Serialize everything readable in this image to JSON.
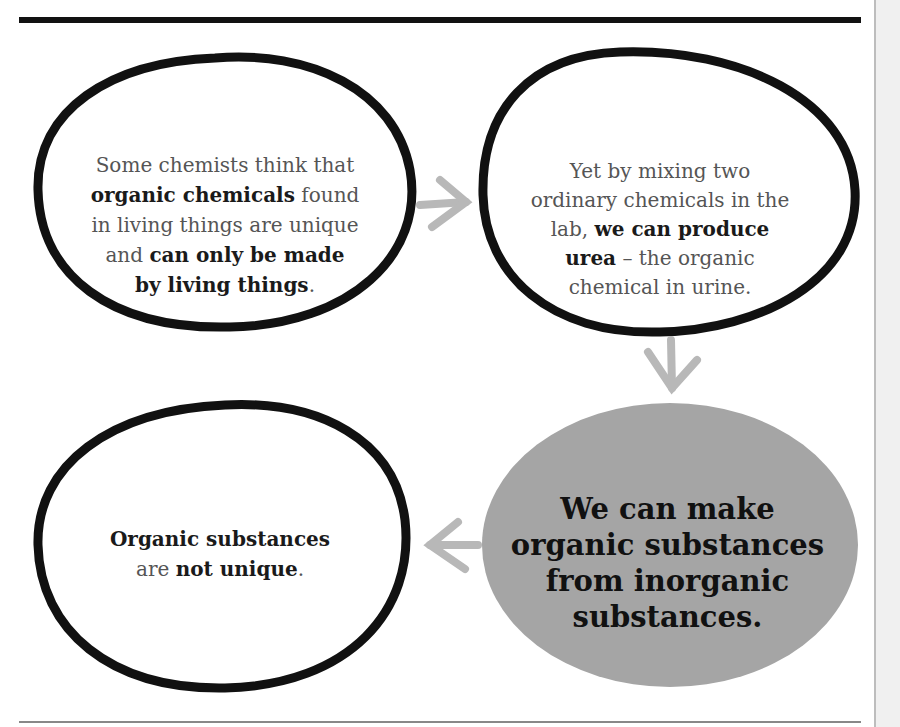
{
  "diagram": {
    "type": "flow",
    "colors": {
      "ink": "#111111",
      "arrow": "#b8b8b8",
      "highlight_fill": "#a5a5a5",
      "text_light": "#555555"
    },
    "nodes": [
      {
        "id": "belief",
        "shape": "hand-drawn-ellipse",
        "lines": [
          {
            "parts": [
              {
                "text": "Some chemists think that",
                "bold": false
              }
            ]
          },
          {
            "parts": [
              {
                "text": "organic chemicals",
                "bold": true
              },
              {
                "text": " found",
                "bold": false
              }
            ]
          },
          {
            "parts": [
              {
                "text": "in living things are unique",
                "bold": false
              }
            ]
          },
          {
            "parts": [
              {
                "text": "and ",
                "bold": false
              },
              {
                "text": "can only be made",
                "bold": true
              }
            ]
          },
          {
            "parts": [
              {
                "text": "by living things",
                "bold": true
              },
              {
                "text": ".",
                "bold": false
              }
            ]
          }
        ]
      },
      {
        "id": "experiment",
        "shape": "hand-drawn-ellipse",
        "lines": [
          {
            "parts": [
              {
                "text": "Yet by mixing two",
                "bold": false
              }
            ]
          },
          {
            "parts": [
              {
                "text": "ordinary chemicals in the",
                "bold": false
              }
            ]
          },
          {
            "parts": [
              {
                "text": "lab, ",
                "bold": false
              },
              {
                "text": "we can produce",
                "bold": true
              }
            ]
          },
          {
            "parts": [
              {
                "text": "urea",
                "bold": true
              },
              {
                "text": " – the organic",
                "bold": false
              }
            ]
          },
          {
            "parts": [
              {
                "text": "chemical in urine.",
                "bold": false
              }
            ]
          }
        ]
      },
      {
        "id": "result",
        "shape": "filled-ellipse",
        "lines": [
          {
            "parts": [
              {
                "text": "We can make",
                "bold": true
              }
            ]
          },
          {
            "parts": [
              {
                "text": "organic substances",
                "bold": true
              }
            ]
          },
          {
            "parts": [
              {
                "text": "from inorganic",
                "bold": true
              }
            ]
          },
          {
            "parts": [
              {
                "text": "substances.",
                "bold": true
              }
            ]
          }
        ]
      },
      {
        "id": "conclusion",
        "shape": "hand-drawn-ellipse",
        "lines": [
          {
            "parts": [
              {
                "text": "Organic substances",
                "bold": true
              }
            ]
          },
          {
            "parts": [
              {
                "text": "are ",
                "bold": false
              },
              {
                "text": "not unique",
                "bold": true
              },
              {
                "text": ".",
                "bold": false
              }
            ]
          }
        ]
      }
    ],
    "edges": [
      {
        "from": "belief",
        "to": "experiment",
        "direction": "right"
      },
      {
        "from": "experiment",
        "to": "result",
        "direction": "down"
      },
      {
        "from": "result",
        "to": "conclusion",
        "direction": "left"
      }
    ]
  }
}
